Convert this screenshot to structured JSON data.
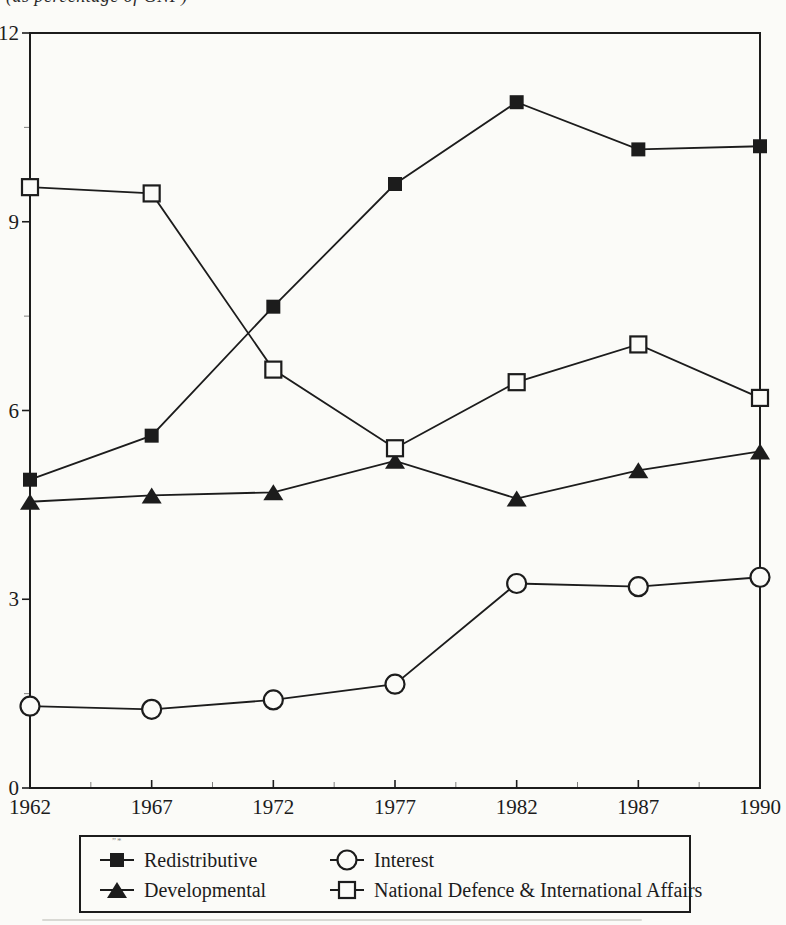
{
  "caption": {
    "text": "(as percentage of GNP)"
  },
  "colors": {
    "ink": "#1c1c1c",
    "background": "#fbfbf8"
  },
  "chart_data": {
    "type": "line",
    "title": "",
    "xlabel": "",
    "ylabel": "",
    "categories": [
      "1962",
      "1967",
      "1972",
      "1977",
      "1982",
      "1987",
      "1990"
    ],
    "series": [
      {
        "name": "Redistributive",
        "marker": "filled-square",
        "values": [
          4.9,
          5.6,
          7.65,
          9.6,
          10.9,
          10.15,
          10.2
        ]
      },
      {
        "name": "Developmental",
        "marker": "filled-triangle",
        "values": [
          4.55,
          4.65,
          4.7,
          5.2,
          4.6,
          5.05,
          5.35
        ]
      },
      {
        "name": "Interest",
        "marker": "open-circle",
        "values": [
          1.3,
          1.25,
          1.4,
          1.65,
          3.25,
          3.2,
          3.35
        ]
      },
      {
        "name": "National Defence & International Affairs",
        "marker": "open-square",
        "values": [
          9.55,
          9.45,
          6.65,
          5.4,
          6.45,
          7.05,
          6.2
        ]
      }
    ],
    "ylim": [
      0,
      12
    ],
    "yticks": [
      0,
      3,
      6,
      9,
      12
    ],
    "y_minor_ticks": [
      1.5,
      4.5,
      7.5,
      10.5
    ],
    "x_minor_ticks": "midpoints-between-categories",
    "grid": false,
    "legend": {
      "position": "bottom-box",
      "entries": [
        {
          "label": "Redistributive",
          "marker": "filled-square"
        },
        {
          "label": "Interest",
          "marker": "open-circle"
        },
        {
          "label": "Developmental",
          "marker": "filled-triangle"
        },
        {
          "label": "National Defence & International Affairs",
          "marker": "open-square"
        }
      ]
    }
  },
  "scan_artifact_mark": "”*"
}
